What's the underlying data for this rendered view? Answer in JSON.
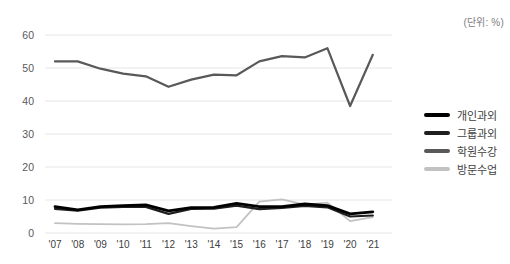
{
  "chart_data": {
    "type": "line",
    "title": "",
    "unit_label": "(단위: %)",
    "xlabel": "",
    "ylabel": "",
    "categories": [
      "'07",
      "'08",
      "'09",
      "'10",
      "'11",
      "'12",
      "'13",
      "'14",
      "'15",
      "'16",
      "'17",
      "'18",
      "'19",
      "'20",
      "'21"
    ],
    "series": [
      {
        "name": "개인과외",
        "color": "#000000",
        "stroke_width": 2.8,
        "values": [
          8.0,
          7.0,
          8.0,
          8.3,
          8.5,
          6.7,
          7.7,
          7.8,
          9.0,
          8.0,
          8.0,
          8.8,
          8.3,
          5.8,
          6.4
        ]
      },
      {
        "name": "그룹과외",
        "color": "#1f1f1f",
        "stroke_width": 2.2,
        "values": [
          7.3,
          6.8,
          7.7,
          7.9,
          7.9,
          5.8,
          7.3,
          7.4,
          8.3,
          7.2,
          7.6,
          8.2,
          7.8,
          5.0,
          5.3
        ]
      },
      {
        "name": "학원수강",
        "color": "#595959",
        "stroke_width": 2.2,
        "values": [
          52.0,
          52.0,
          49.8,
          48.3,
          47.5,
          44.3,
          46.5,
          48.0,
          47.8,
          52.0,
          53.6,
          53.2,
          56.0,
          38.5,
          54.0
        ]
      },
      {
        "name": "방문수업",
        "color": "#c2c2c2",
        "stroke_width": 1.8,
        "values": [
          3.0,
          2.8,
          2.7,
          2.6,
          2.7,
          3.0,
          2.1,
          1.3,
          1.8,
          9.5,
          10.2,
          8.6,
          9.2,
          3.6,
          4.8
        ]
      }
    ],
    "ylim": [
      0,
      60
    ],
    "yticks": [
      0,
      10,
      20,
      30,
      40,
      50,
      60
    ],
    "grid": "horizontal",
    "legend_position": "right"
  },
  "colors": {
    "gridline": "#e6e6e6",
    "ytick_text": "#595959",
    "xtick_text": "#404040",
    "unit_text": "#808080",
    "legend_text": "#404040",
    "background": "#ffffff"
  }
}
